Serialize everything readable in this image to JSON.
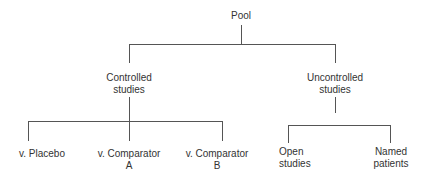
{
  "diagram": {
    "type": "tree",
    "root": {
      "label": "Pool"
    },
    "level1": [
      {
        "line1": "Controlled",
        "line2": "studies"
      },
      {
        "line1": "Uncontrolled",
        "line2": "studies"
      }
    ],
    "controlled_children": [
      {
        "line1": "v. Placebo",
        "line2": ""
      },
      {
        "line1": "v. Comparator",
        "line2": "A"
      },
      {
        "line1": "v. Comparator",
        "line2": "B"
      }
    ],
    "uncontrolled_children": [
      {
        "line1": "Open",
        "line2": "studies"
      },
      {
        "line1": "Named",
        "line2": "patients"
      }
    ],
    "colors": {
      "line": "#555555",
      "text": "#333333",
      "background": "#ffffff"
    }
  }
}
